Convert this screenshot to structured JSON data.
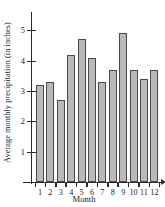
{
  "chart_data": {
    "type": "bar",
    "title": "",
    "xlabel": "Month",
    "ylabel": "Average monthly precipitation (in inches)",
    "categories": [
      "1",
      "2",
      "3",
      "4",
      "5",
      "6",
      "7",
      "8",
      "9",
      "10",
      "11",
      "12"
    ],
    "values": [
      3.2,
      3.3,
      2.7,
      4.2,
      4.7,
      4.1,
      3.3,
      3.7,
      4.9,
      3.7,
      3.4,
      3.7
    ],
    "ylim": [
      0,
      5.6
    ],
    "ytick_labels": [
      "1",
      "2",
      "3",
      "4",
      "5"
    ],
    "ytick_values": [
      1,
      2,
      3,
      4,
      5
    ],
    "grid": false,
    "legend": false,
    "bar_fill_color": "#b9b9b9",
    "bar_edge_color": "#4a4a4a",
    "axis_color": "#2b2b2b"
  }
}
